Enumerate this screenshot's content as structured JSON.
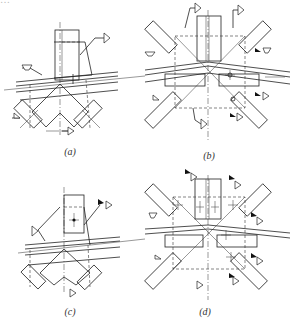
{
  "figure": {
    "top_cut_text": "…",
    "panels": [
      {
        "id": "a",
        "caption": "(a)",
        "description": "Truss node: vertical member with gusset over chord, two diagonals below, fillet weld symbols"
      },
      {
        "id": "b",
        "caption": "(b)",
        "description": "Truss ridge node: vertical, four diagonals, chord splice with site weld flags"
      },
      {
        "id": "c",
        "caption": "(c)",
        "description": "Truss node: vertical member bolted with gusset, two diagonals below"
      },
      {
        "id": "d",
        "caption": "(d)",
        "description": "Truss ridge node: vertical with bolts, four diagonals with bolts, site weld flags"
      }
    ]
  }
}
